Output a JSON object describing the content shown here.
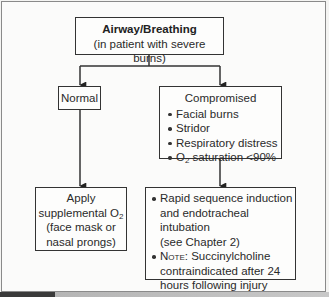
{
  "flowchart": {
    "root": {
      "title": "Airway/Breathing",
      "subtitle": "(in patient with severe burns)"
    },
    "normal": {
      "label": "Normal"
    },
    "compromised": {
      "label": "Compromised",
      "items": [
        "Facial burns",
        "Stridor",
        "Respiratory distress"
      ],
      "o2_item": {
        "prefix": "O",
        "sub": "2",
        "suffix": " saturation <90%"
      }
    },
    "normal_action": {
      "line1": "Apply",
      "line2_prefix": "supplemental O",
      "line2_sub": "2",
      "line3": "(face mask or",
      "line4": "nasal prongs)"
    },
    "compromised_action": {
      "item1_line1": "Rapid sequence induction",
      "item1_line2": "and endotracheal intubation",
      "item1_line3": "(see Chapter 2)",
      "item2_note_label": "Note:",
      "item2_line1": " Succinylcholine",
      "item2_line2": "contraindicated after 24",
      "item2_line3": "hours following injury"
    }
  }
}
